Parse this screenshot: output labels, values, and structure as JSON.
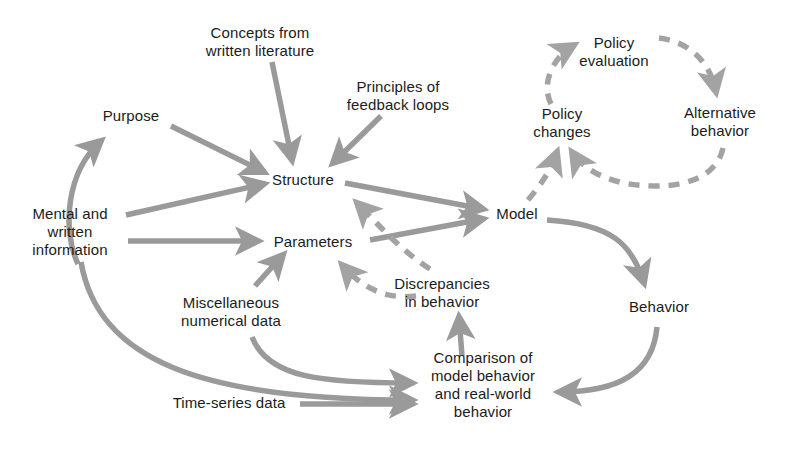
{
  "diagram": {
    "style": {
      "background": "#ffffff",
      "arrow_color": "#9a9a9a",
      "dashed_arrow_color": "#a3a3a3",
      "text_color": "#1b1b1b"
    },
    "nodes": [
      {
        "id": "purpose",
        "label": "Purpose",
        "x": 131,
        "y": 116
      },
      {
        "id": "concepts",
        "label": "Concepts from\nwritten literature",
        "x": 260,
        "y": 42
      },
      {
        "id": "principles",
        "label": "Principles of\nfeedback loops",
        "x": 398,
        "y": 96
      },
      {
        "id": "structure",
        "label": "Structure",
        "x": 303,
        "y": 180
      },
      {
        "id": "mental",
        "label": "Mental and\nwritten\ninformation",
        "x": 70,
        "y": 232
      },
      {
        "id": "parameters",
        "label": "Parameters",
        "x": 313,
        "y": 242
      },
      {
        "id": "miscellaneous",
        "label": "Miscellaneous\nnumerical data",
        "x": 231,
        "y": 312
      },
      {
        "id": "discrepancies",
        "label": "Discrepancies\nin behavior",
        "x": 442,
        "y": 293
      },
      {
        "id": "model",
        "label": "Model",
        "x": 517,
        "y": 214
      },
      {
        "id": "policy_changes",
        "label": "Policy\nchanges",
        "x": 562,
        "y": 123
      },
      {
        "id": "policy_eval",
        "label": "Policy\nevaluation",
        "x": 614,
        "y": 52
      },
      {
        "id": "alternative",
        "label": "Alternative\nbehavior",
        "x": 720,
        "y": 122
      },
      {
        "id": "behavior",
        "label": "Behavior",
        "x": 659,
        "y": 307
      },
      {
        "id": "comparison",
        "label": "Comparison of\nmodel behavior\nand real-world\nbehavior",
        "x": 483,
        "y": 385
      },
      {
        "id": "timeseries",
        "label": "Time-series data",
        "x": 229,
        "y": 403
      }
    ],
    "edges": [
      {
        "from": "mental",
        "to": "purpose",
        "style": "solid",
        "shape": "curve"
      },
      {
        "from": "purpose",
        "to": "structure",
        "style": "solid",
        "shape": "straight"
      },
      {
        "from": "concepts",
        "to": "structure",
        "style": "solid",
        "shape": "straight"
      },
      {
        "from": "principles",
        "to": "structure",
        "style": "solid",
        "shape": "straight"
      },
      {
        "from": "mental",
        "to": "structure",
        "style": "solid",
        "shape": "straight"
      },
      {
        "from": "mental",
        "to": "parameters",
        "style": "solid",
        "shape": "straight"
      },
      {
        "from": "miscellaneous",
        "to": "parameters",
        "style": "solid",
        "shape": "straight"
      },
      {
        "from": "structure",
        "to": "model",
        "style": "solid",
        "shape": "straight"
      },
      {
        "from": "parameters",
        "to": "model",
        "style": "solid",
        "shape": "straight"
      },
      {
        "from": "discrepancies",
        "to": "structure",
        "style": "dashed",
        "shape": "curve"
      },
      {
        "from": "discrepancies",
        "to": "parameters",
        "style": "dashed",
        "shape": "curve"
      },
      {
        "from": "model",
        "to": "behavior",
        "style": "solid",
        "shape": "curve"
      },
      {
        "from": "behavior",
        "to": "comparison",
        "style": "solid",
        "shape": "curve"
      },
      {
        "from": "comparison",
        "to": "discrepancies",
        "style": "solid",
        "shape": "straight"
      },
      {
        "from": "miscellaneous",
        "to": "comparison",
        "style": "solid",
        "shape": "curve"
      },
      {
        "from": "mental",
        "to": "comparison",
        "style": "solid",
        "shape": "curve"
      },
      {
        "from": "timeseries",
        "to": "comparison",
        "style": "solid",
        "shape": "straight"
      },
      {
        "from": "model",
        "to": "policy_changes",
        "style": "dashed",
        "shape": "curve"
      },
      {
        "from": "policy_changes",
        "to": "policy_eval",
        "style": "dashed",
        "shape": "curve"
      },
      {
        "from": "policy_eval",
        "to": "alternative",
        "style": "dashed",
        "shape": "curve"
      },
      {
        "from": "alternative",
        "to": "policy_changes",
        "style": "dashed",
        "shape": "curve"
      }
    ]
  }
}
